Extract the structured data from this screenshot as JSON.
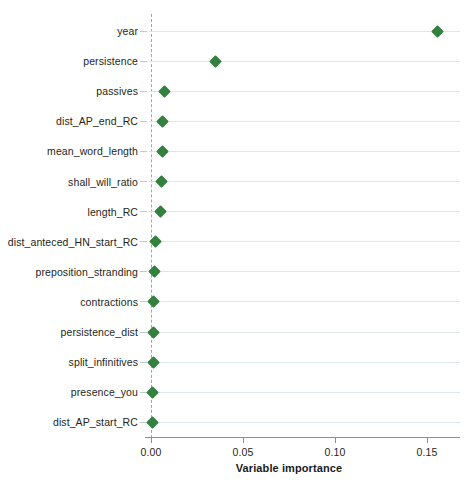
{
  "chart_data": {
    "type": "scatter",
    "title": "",
    "xlabel": "Variable importance",
    "ylabel": "",
    "xlim": [
      -0.012,
      0.168
    ],
    "xticks": [
      0.0,
      0.05,
      0.1,
      0.15
    ],
    "xticklabels": [
      "0.00",
      "0.05",
      "0.10",
      "0.15"
    ],
    "grid": "horizontal",
    "legend": "none",
    "reference_line": {
      "value": 0.0,
      "style": "dashed",
      "color": "#e08b84"
    },
    "marker": {
      "shape": "diamond",
      "color": "#33803f",
      "size": 9
    },
    "categories": [
      "year",
      "persistence",
      "passives",
      "dist_AP_end_RC",
      "mean_word_length",
      "shall_will_ratio",
      "length_RC",
      "dist_anteced_HN_start_RC",
      "preposition_stranding",
      "contractions",
      "persistence_dist",
      "split_infinitives",
      "presence_you",
      "dist_AP_start_RC"
    ],
    "values": [
      0.1555,
      0.0348,
      0.0076,
      0.0065,
      0.006,
      0.0055,
      0.005,
      0.0022,
      0.0018,
      0.0014,
      0.0013,
      0.0011,
      0.0008,
      0.0006
    ],
    "points": [
      {
        "label": "year",
        "value": 0.1555
      },
      {
        "label": "persistence",
        "value": 0.0348
      },
      {
        "label": "passives",
        "value": 0.0076
      },
      {
        "label": "dist_AP_end_RC",
        "value": 0.0065
      },
      {
        "label": "mean_word_length",
        "value": 0.006
      },
      {
        "label": "shall_will_ratio",
        "value": 0.0055
      },
      {
        "label": "length_RC",
        "value": 0.005
      },
      {
        "label": "dist_anteced_HN_start_RC",
        "value": 0.0022
      },
      {
        "label": "preposition_stranding",
        "value": 0.0018
      },
      {
        "label": "contractions",
        "value": 0.0014
      },
      {
        "label": "persistence_dist",
        "value": 0.0013
      },
      {
        "label": "split_infinitives",
        "value": 0.0011
      },
      {
        "label": "presence_you",
        "value": 0.0008
      },
      {
        "label": "dist_AP_start_RC",
        "value": 0.0006
      }
    ]
  },
  "axis": {
    "x_title": "Variable importance",
    "x_tick_labels": [
      "0.00",
      "0.05",
      "0.10",
      "0.15"
    ]
  },
  "caption": {
    "partial_text": ""
  },
  "colors": {
    "marker": "#33803f",
    "gridline": "#dbe7ed",
    "reference_line": "#e08b84",
    "axis": "#8e8e8e",
    "text": "#231f20"
  }
}
